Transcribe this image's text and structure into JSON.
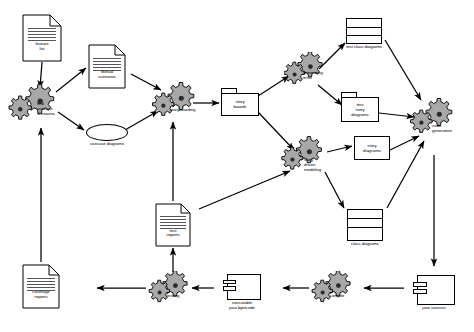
{
  "diagram": {
    "colors": {
      "stroke": "#000000",
      "fill": "#ffffff",
      "gear_light": "#b0b0b0",
      "gear_dark": "#9a9a9a",
      "text": "#000000"
    },
    "nodes": [
      {
        "id": "feature-list",
        "type": "document",
        "label": "feature\nlist"
      },
      {
        "id": "find-usecase-scenarios",
        "type": "activity",
        "label": "find\nusecase\nscenarios"
      },
      {
        "id": "textual-scenarios",
        "type": "document",
        "label": "textual\nscenarios"
      },
      {
        "id": "usecase-diagrams",
        "type": "usecase",
        "label": "usecase diagrams"
      },
      {
        "id": "storyboarding",
        "type": "activity",
        "label": "storyboarding"
      },
      {
        "id": "story-boards",
        "type": "package",
        "label": "story\nboards"
      },
      {
        "id": "generating-tests",
        "type": "activity",
        "label": "generating\ntests"
      },
      {
        "id": "test-class-diagrams",
        "type": "class",
        "label": "test class diagrams"
      },
      {
        "id": "test-story-diagrams",
        "type": "package",
        "label": "test\nstory\ndiagrams"
      },
      {
        "id": "story-driven-modeling",
        "type": "activity",
        "label": "story\ndriven\nmodeling"
      },
      {
        "id": "story-diagrams",
        "type": "class",
        "label": "story\ndiagrams"
      },
      {
        "id": "class-diagrams",
        "type": "class",
        "label": "class diagrams"
      },
      {
        "id": "code-generation",
        "type": "activity",
        "label": "code\ngeneration"
      },
      {
        "id": "java-sources",
        "type": "component",
        "label": "java sources"
      },
      {
        "id": "compile",
        "type": "activity",
        "label": "compile"
      },
      {
        "id": "executable-java-bytecode",
        "type": "component",
        "label": "executable\njava bytecode"
      },
      {
        "id": "testing",
        "type": "activity",
        "label": "testing"
      },
      {
        "id": "coverage-reports",
        "type": "document",
        "label": "coverage\nreports"
      },
      {
        "id": "test-reports",
        "type": "document",
        "label": "test\nreports"
      }
    ],
    "edges": [
      {
        "from": "feature-list",
        "to": "find-usecase-scenarios"
      },
      {
        "from": "find-usecase-scenarios",
        "to": "textual-scenarios"
      },
      {
        "from": "find-usecase-scenarios",
        "to": "usecase-diagrams"
      },
      {
        "from": "textual-scenarios",
        "to": "storyboarding"
      },
      {
        "from": "usecase-diagrams",
        "to": "storyboarding"
      },
      {
        "from": "storyboarding",
        "to": "story-boards"
      },
      {
        "from": "story-boards",
        "to": "generating-tests"
      },
      {
        "from": "story-boards",
        "to": "story-driven-modeling"
      },
      {
        "from": "generating-tests",
        "to": "test-class-diagrams"
      },
      {
        "from": "generating-tests",
        "to": "test-story-diagrams"
      },
      {
        "from": "test-class-diagrams",
        "to": "code-generation"
      },
      {
        "from": "test-story-diagrams",
        "to": "code-generation"
      },
      {
        "from": "story-driven-modeling",
        "to": "story-diagrams"
      },
      {
        "from": "story-driven-modeling",
        "to": "class-diagrams"
      },
      {
        "from": "story-diagrams",
        "to": "code-generation"
      },
      {
        "from": "class-diagrams",
        "to": "code-generation"
      },
      {
        "from": "code-generation",
        "to": "java-sources"
      },
      {
        "from": "java-sources",
        "to": "compile"
      },
      {
        "from": "compile",
        "to": "executable-java-bytecode"
      },
      {
        "from": "executable-java-bytecode",
        "to": "testing"
      },
      {
        "from": "testing",
        "to": "coverage-reports"
      },
      {
        "from": "testing",
        "to": "test-reports"
      },
      {
        "from": "coverage-reports",
        "to": "find-usecase-scenarios"
      },
      {
        "from": "test-reports",
        "to": "storyboarding"
      },
      {
        "from": "test-reports",
        "to": "story-driven-modeling"
      }
    ]
  }
}
